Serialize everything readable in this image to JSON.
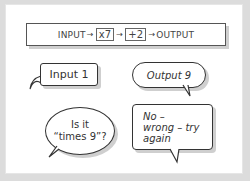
{
  "machine": {
    "input_label": "INPUT",
    "op1": "x7",
    "op2": "+2",
    "output_label": "OUTPUT",
    "arrow": "→"
  },
  "bubbles": [
    {
      "text": "Input 1",
      "shape": "rectangle"
    },
    {
      "text": "Output 9",
      "shape": "rounded"
    },
    {
      "line1": "Is it",
      "line2": "“times 9”?",
      "shape": "oval"
    },
    {
      "line1": "No –",
      "line2": "wrong – try",
      "line3": "again",
      "shape": "rectangle"
    }
  ]
}
